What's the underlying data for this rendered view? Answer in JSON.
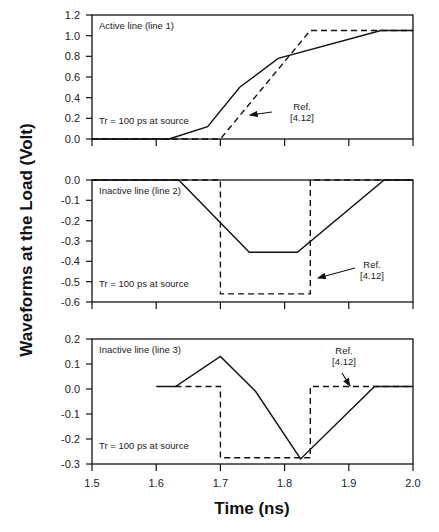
{
  "chart_data": {
    "type": "line",
    "xlabel": "Time (ns)",
    "ylabel": "Waveforms at the Load (Volt)",
    "xlim": [
      1.5,
      2.0
    ],
    "x_ticks": [
      "1.5",
      "1.6",
      "1.7",
      "1.8",
      "1.9",
      "2.0"
    ],
    "panels": [
      {
        "title": "Active line (line 1)",
        "note": "Tr = 100 ps at source",
        "ylim": [
          0.0,
          1.2
        ],
        "y_ticks": [
          "1.2",
          "1.0",
          "0.8",
          "0.6",
          "0.4",
          "0.2",
          "0.0"
        ],
        "annotation": {
          "text_line1": "Ref.",
          "text_line2": "[4.12]",
          "target": "dashed"
        },
        "series": [
          {
            "name": "Simulated",
            "style": "solid",
            "x": [
              1.5,
              1.62,
              1.68,
              1.73,
              1.79,
              1.95,
              2.0
            ],
            "y": [
              0.0,
              0.0,
              0.12,
              0.5,
              0.78,
              1.05,
              1.05
            ]
          },
          {
            "name": "Ref. [4.12]",
            "style": "dashed",
            "x": [
              1.5,
              1.7,
              1.84,
              2.0
            ],
            "y": [
              0.0,
              0.0,
              1.05,
              1.05
            ]
          }
        ]
      },
      {
        "title": "Inactive line (line 2)",
        "note": "Tr = 100 ps at source",
        "ylim": [
          -0.6,
          0.0
        ],
        "y_ticks": [
          "0.0",
          "-0.1",
          "-0.2",
          "-0.3",
          "-0.4",
          "-0.5",
          "-0.6"
        ],
        "annotation": {
          "text_line1": "Ref.",
          "text_line2": "[4.12]",
          "target": "dashed"
        },
        "series": [
          {
            "name": "Simulated",
            "style": "solid",
            "x": [
              1.5,
              1.635,
              1.745,
              1.82,
              1.955,
              2.0
            ],
            "y": [
              0.0,
              0.0,
              -0.355,
              -0.355,
              0.0,
              0.0
            ]
          },
          {
            "name": "Ref. [4.12]",
            "style": "dashed",
            "x": [
              1.5,
              1.7,
              1.7,
              1.84,
              1.84,
              2.0
            ],
            "y": [
              0.0,
              0.0,
              -0.56,
              -0.56,
              0.0,
              0.0
            ]
          }
        ]
      },
      {
        "title": "Inactive line (line 3)",
        "note": "Tr = 100 ps at source",
        "ylim": [
          -0.3,
          0.2
        ],
        "y_ticks": [
          "0.2",
          "0.1",
          "0.0",
          "-0.1",
          "-0.2",
          "-0.3"
        ],
        "annotation": {
          "text_line1": "Ref.",
          "text_line2": "[4.12]",
          "target": "dashed"
        },
        "series": [
          {
            "name": "Simulated",
            "style": "solid",
            "x": [
              1.6,
              1.63,
              1.7,
              1.755,
              1.825,
              1.94,
              2.0
            ],
            "y": [
              0.01,
              0.01,
              0.13,
              -0.01,
              -0.28,
              0.01,
              0.01
            ]
          },
          {
            "name": "Ref. [4.12]",
            "style": "dashed",
            "x": [
              1.63,
              1.7,
              1.7,
              1.84,
              1.84,
              2.0
            ],
            "y": [
              0.01,
              0.01,
              -0.275,
              -0.275,
              0.01,
              0.01
            ]
          }
        ]
      }
    ]
  }
}
